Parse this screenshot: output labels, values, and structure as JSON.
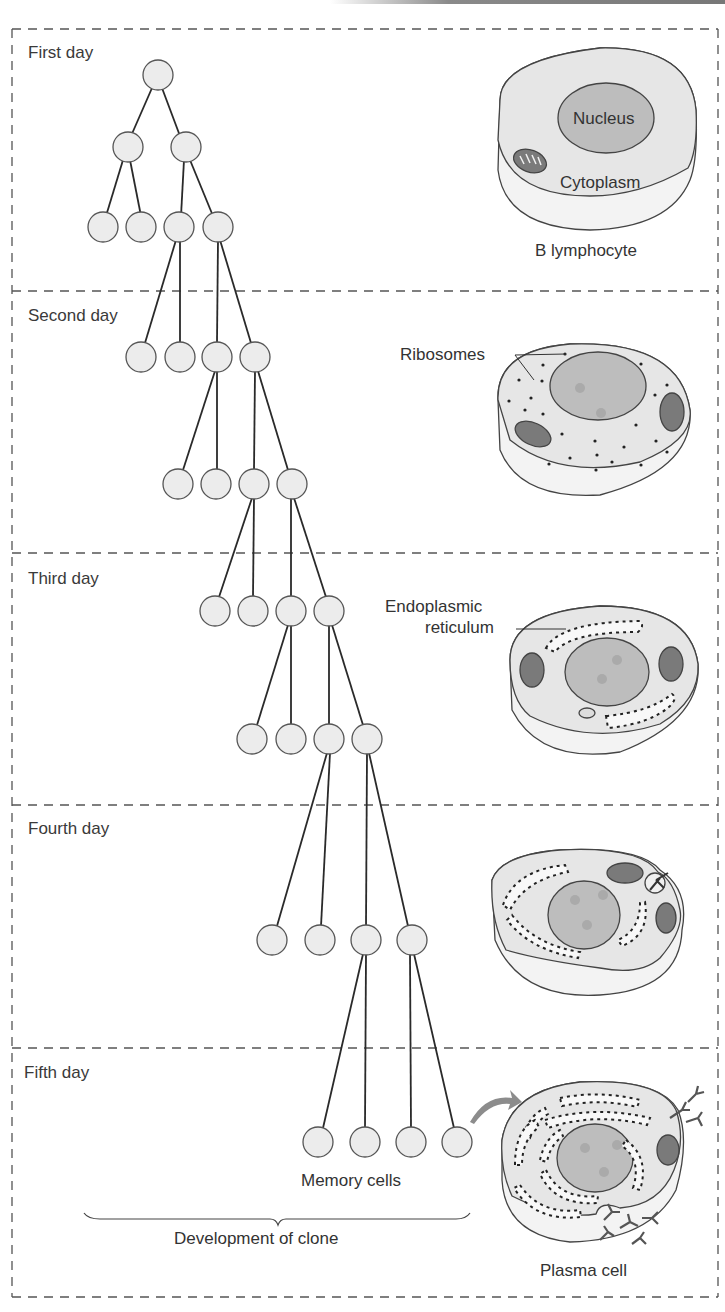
{
  "figure": {
    "title": "Development of clone",
    "days": [
      {
        "label": "First day"
      },
      {
        "label": "Second day"
      },
      {
        "label": "Third day"
      },
      {
        "label": "Fourth day"
      },
      {
        "label": "Fifth day"
      }
    ],
    "cells": {
      "b_lymphocyte": {
        "label": "B lymphocyte",
        "nucleus_label": "Nucleus",
        "cytoplasm_label": "Cytoplasm"
      },
      "day2": {
        "annotation": "Ribosomes"
      },
      "day3": {
        "annotation_line1": "Endoplasmic",
        "annotation_line2": "reticulum"
      },
      "plasma": {
        "label": "Plasma cell"
      }
    },
    "memory_cells_label": "Memory cells",
    "brace_label": "Development of clone"
  },
  "colors": {
    "cell_fill": "#e8e8e8",
    "cell_side": "#f2f2f2",
    "nucleus_fill": "#bdbdbd",
    "outline": "#444444",
    "divider": "#555555",
    "node_fill": "#ececec",
    "arrow": "#8c8c8c"
  }
}
